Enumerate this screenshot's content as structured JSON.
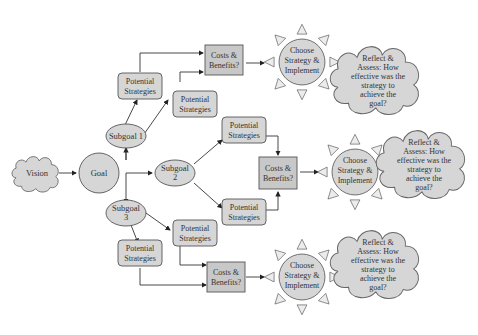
{
  "diagram": {
    "colors": {
      "node_fill": "#d6d6d6",
      "box_fill": "#c8c8c8",
      "stroke": "#555555",
      "background": "#ffffff"
    },
    "nodes": {
      "vision": {
        "label": "Vision",
        "shape": "cloud"
      },
      "goal": {
        "label": "Goal",
        "shape": "circle"
      },
      "subgoal1": {
        "label": "Subgoal 1",
        "shape": "ellipse"
      },
      "subgoal2": {
        "label_l1": "Subgoal",
        "label_l2": "2",
        "shape": "ellipse"
      },
      "subgoal3": {
        "label_l1": "Subgoal",
        "label_l2": "3",
        "shape": "ellipse"
      },
      "ps_1a": {
        "label_l1": "Potential",
        "label_l2": "Strategies"
      },
      "ps_1b": {
        "label_l1": "Potential",
        "label_l2": "Strategies"
      },
      "ps_2a": {
        "label_l1": "Potential",
        "label_l2": "Strategies"
      },
      "ps_2b": {
        "label_l1": "Potential",
        "label_l2": "Strategies"
      },
      "ps_3a": {
        "label_l1": "Potential",
        "label_l2": "Strategies"
      },
      "ps_3b": {
        "label_l1": "Potential",
        "label_l2": "Strategies"
      },
      "cb_1": {
        "label_l1": "Costs &",
        "label_l2": "Benefits?"
      },
      "cb_2": {
        "label_l1": "Costs &",
        "label_l2": "Benefits?"
      },
      "cb_3": {
        "label_l1": "Costs &",
        "label_l2": "Benefits?"
      },
      "choose_1": {
        "label_l1": "Choose",
        "label_l2": "Strategy &",
        "label_l3": "Implement",
        "shape": "sun"
      },
      "choose_2": {
        "label_l1": "Choose",
        "label_l2": "Strategy &",
        "label_l3": "Implement",
        "shape": "sun"
      },
      "choose_3": {
        "label_l1": "Choose",
        "label_l2": "Strategy &",
        "label_l3": "Implement",
        "shape": "sun"
      },
      "reflect_1": {
        "lines": [
          "Reflect &",
          "Assess: How",
          "effective was the",
          "strategy to",
          "achieve the",
          "goal?"
        ],
        "shape": "cloud"
      },
      "reflect_2": {
        "lines": [
          "Reflect &",
          "Assess: How",
          "effective was the",
          "strategy to",
          "achieve the",
          "goal?"
        ],
        "shape": "cloud"
      },
      "reflect_3": {
        "lines": [
          "Reflect &",
          "Assess: How",
          "effective was the",
          "strategy to",
          "achieve the",
          "goal?"
        ],
        "shape": "cloud"
      }
    },
    "edges": [
      [
        "vision",
        "goal"
      ],
      [
        "goal",
        "subgoal1"
      ],
      [
        "goal",
        "subgoal2"
      ],
      [
        "goal",
        "subgoal3"
      ],
      [
        "subgoal1",
        "ps_1a"
      ],
      [
        "subgoal1",
        "ps_1b"
      ],
      [
        "ps_1a",
        "cb_1"
      ],
      [
        "ps_1b",
        "cb_1"
      ],
      [
        "cb_1",
        "choose_1"
      ],
      [
        "subgoal2",
        "ps_2a"
      ],
      [
        "subgoal2",
        "ps_2b"
      ],
      [
        "ps_2a",
        "cb_2"
      ],
      [
        "ps_2b",
        "cb_2"
      ],
      [
        "cb_2",
        "choose_2"
      ],
      [
        "subgoal3",
        "ps_3a"
      ],
      [
        "subgoal3",
        "ps_3b"
      ],
      [
        "ps_3a",
        "cb_3"
      ],
      [
        "ps_3b",
        "cb_3"
      ],
      [
        "cb_3",
        "choose_3"
      ]
    ]
  }
}
